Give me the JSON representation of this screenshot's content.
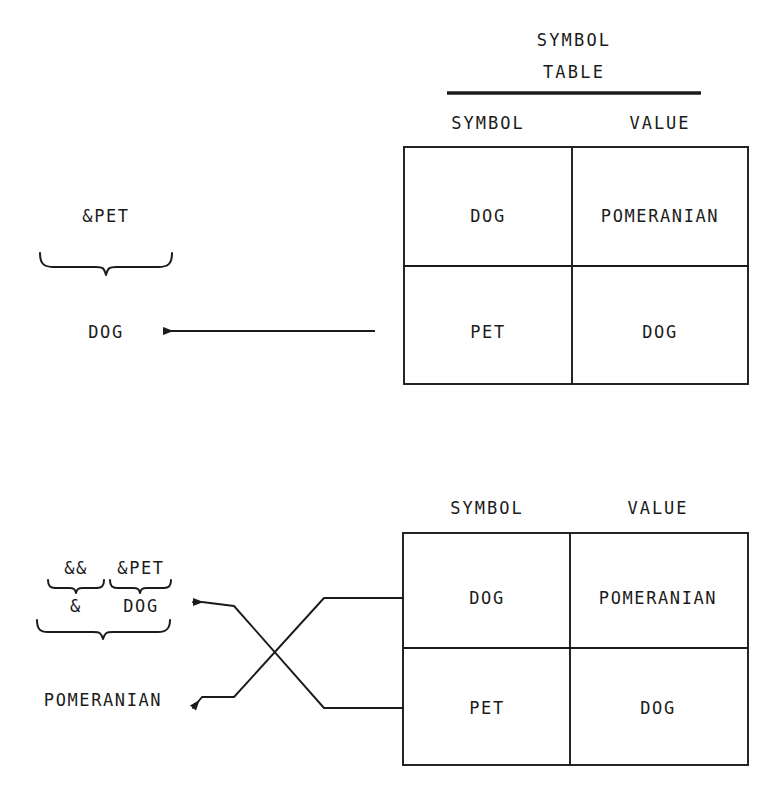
{
  "figure": {
    "kind": "symbol-table-substitution-diagram",
    "background_color": "#ffffff",
    "ink_color": "#1b1b1b"
  },
  "header": {
    "title_line1": "SYMBOL",
    "title_line2": "TABLE",
    "rule": "underline"
  },
  "panels": [
    {
      "id": "single-indirection",
      "expression": {
        "input": "&PET",
        "result": "DOG",
        "brace": "down"
      },
      "arrow": {
        "direction": "left",
        "from": "symbol-table-row-pet",
        "to": "result-DOG"
      },
      "table": {
        "columns": [
          "SYMBOL",
          "VALUE"
        ],
        "rows": [
          {
            "symbol": "DOG",
            "value": "POMERANIAN"
          },
          {
            "symbol": "PET",
            "value": "DOG"
          }
        ]
      }
    },
    {
      "id": "double-indirection",
      "expression": {
        "line1_tokens": [
          "&&",
          "&PET"
        ],
        "line2_tokens": [
          "&",
          "DOG"
        ],
        "result": "POMERANIAN",
        "braces": [
          "down",
          "down",
          "down"
        ]
      },
      "arrows": [
        {
          "direction": "left",
          "from": "symbol-table-row-pet",
          "to": "expression-line2",
          "crossing": true
        },
        {
          "direction": "left",
          "from": "symbol-table-row-dog",
          "to": "result-POMERANIAN",
          "crossing": true
        }
      ],
      "table": {
        "columns": [
          "SYMBOL",
          "VALUE"
        ],
        "rows": [
          {
            "symbol": "DOG",
            "value": "POMERANIAN"
          },
          {
            "symbol": "PET",
            "value": "DOG"
          }
        ]
      }
    }
  ]
}
